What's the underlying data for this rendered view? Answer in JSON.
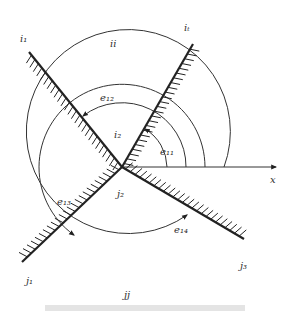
{
  "diagram": {
    "labels": {
      "i1": "i₁",
      "ii": "ii",
      "i_top": "iₜ",
      "i2": "i₂",
      "j1": "j₁",
      "j2": "j₂",
      "j3": "j₃",
      "jj": "jj",
      "x": "x",
      "e11": "e₁₁",
      "e12": "e₁₂",
      "e13": "e₁₃",
      "e14": "e₁₄"
    },
    "colors": {
      "line": "#222222",
      "background": "#ffffff"
    }
  }
}
